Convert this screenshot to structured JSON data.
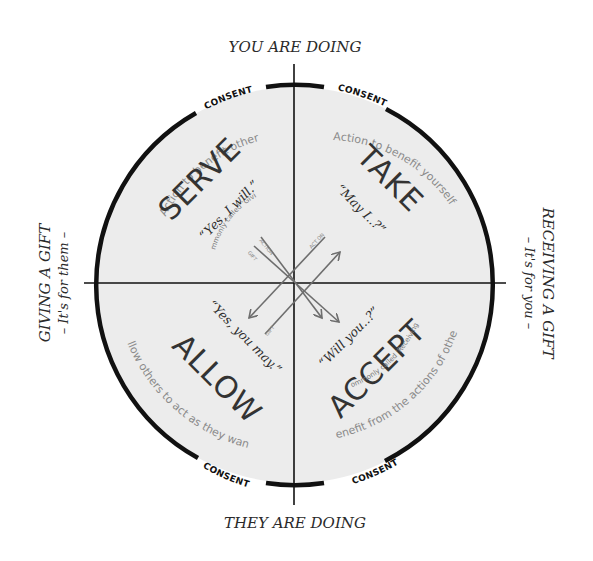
{
  "axes": {
    "top": "YOU ARE DOING",
    "bottom": "THEY ARE DOING",
    "left": {
      "title": "GIVING A GIFT",
      "subtitle": "– It's for them –"
    },
    "right": {
      "title": "RECEIVING A GIFT",
      "subtitle": "– It's for you –"
    }
  },
  "consent_label": "CONSENT",
  "quadrants": {
    "serve": {
      "title": "SERVE",
      "note": "(Commonly called 'Giving')",
      "quote": "“Yes, I will.”",
      "description": "Action to benefit others"
    },
    "take": {
      "title": "TAKE",
      "quote": "“May I..?”",
      "description": "Action to benefit yourself"
    },
    "allow": {
      "title": "ALLOW",
      "quote": "“Yes, you may.”",
      "description": "Allow others to act as they want"
    },
    "accept": {
      "title": "ACCEPT",
      "note": "(Commonly called 'Receiving')",
      "quote": "“Will you..?”",
      "description": "Benefit from the actions of others"
    }
  },
  "arrows": {
    "action": "ACTION",
    "gift_top": "GIFT",
    "act_on": "ACT ON",
    "gift_bottom": "GIFT"
  },
  "colors": {
    "circle_fill": "#ececec",
    "stroke": "#111111",
    "arrow": "#6e6e6e",
    "text_dark": "#333333",
    "text_light": "#8a8a8a"
  }
}
